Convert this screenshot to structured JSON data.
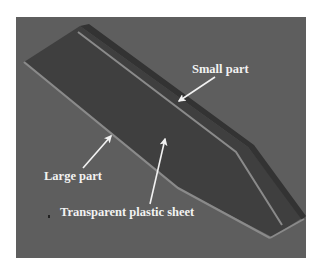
{
  "figure": {
    "background_color": "#ffffff",
    "frame": {
      "x": 16,
      "y": 17,
      "width": 290,
      "height": 241,
      "color": "#5e5e5e"
    },
    "colors": {
      "part_surface": "#3f3f3f",
      "small_part_strip": "#333333",
      "edge_highlight": "#8a8a8a",
      "edge_shadow": "#2a2a2a",
      "label_text": "#f2f2f2",
      "arrow": "#f2f2f2"
    }
  },
  "part": {
    "outline": "24,62 80,26 248,147 302,218 272,237 178,188",
    "small_part_strip": "80,26 89,24 254,145 306,216 302,220 248,147",
    "small_part_inner_line": "78,32 236,152 282,225",
    "large_part_edge": "24,62 178,188 270,238",
    "tip_edge": "270,238 304,219"
  },
  "labels": [
    {
      "id": "small-part",
      "text": "Small part",
      "x": 192,
      "y": 73
    },
    {
      "id": "large-part",
      "text": "Large part",
      "x": 44,
      "y": 180
    },
    {
      "id": "transparent-sheet",
      "text": "Transparent plastic sheet",
      "x": 60,
      "y": 216
    }
  ],
  "arrows": [
    {
      "for": "small-part",
      "x1": 215,
      "y1": 77,
      "x2": 179,
      "y2": 101
    },
    {
      "for": "large-part",
      "x1": 83,
      "y1": 168,
      "x2": 111,
      "y2": 136
    },
    {
      "for": "transparent-sheet",
      "x1": 150,
      "y1": 204,
      "x2": 165,
      "y2": 139
    }
  ]
}
